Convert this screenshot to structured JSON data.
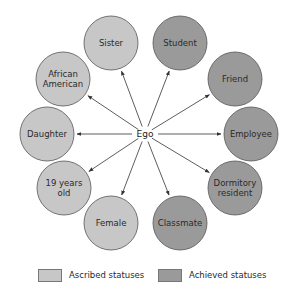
{
  "diagram": {
    "center": {
      "label": "Ego",
      "x": 145,
      "y": 134
    },
    "node_radius": 27,
    "colors": {
      "ascribed": "#c7c7c7",
      "achieved": "#9a9a9a",
      "stroke": "#555555",
      "arrow": "#333333"
    },
    "nodes": [
      {
        "id": "sister",
        "lines": [
          "Sister"
        ],
        "type": "ascribed",
        "x": 111,
        "y": 43
      },
      {
        "id": "african-american",
        "lines": [
          "African",
          "American"
        ],
        "type": "ascribed",
        "x": 63,
        "y": 79
      },
      {
        "id": "daughter",
        "lines": [
          "Daughter"
        ],
        "type": "ascribed",
        "x": 47,
        "y": 134
      },
      {
        "id": "19-years-old",
        "lines": [
          "19 years",
          "old"
        ],
        "type": "ascribed",
        "x": 64,
        "y": 188
      },
      {
        "id": "female",
        "lines": [
          "Female"
        ],
        "type": "ascribed",
        "x": 111,
        "y": 223
      },
      {
        "id": "student",
        "lines": [
          "Student"
        ],
        "type": "achieved",
        "x": 180,
        "y": 43
      },
      {
        "id": "friend",
        "lines": [
          "Friend"
        ],
        "type": "achieved",
        "x": 235,
        "y": 79
      },
      {
        "id": "employee",
        "lines": [
          "Employee"
        ],
        "type": "achieved",
        "x": 251,
        "y": 134
      },
      {
        "id": "dormitory-resident",
        "lines": [
          "Dormitory",
          "resident"
        ],
        "type": "achieved",
        "x": 235,
        "y": 188
      },
      {
        "id": "classmate",
        "lines": [
          "Classmate"
        ],
        "type": "achieved",
        "x": 180,
        "y": 223
      }
    ]
  },
  "legend": {
    "ascribed": {
      "label": "Ascribed statuses",
      "color": "#c7c7c7"
    },
    "achieved": {
      "label": "Achieved statuses",
      "color": "#9a9a9a"
    }
  }
}
